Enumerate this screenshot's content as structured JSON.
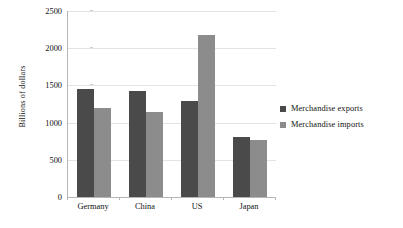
{
  "chart_data": {
    "type": "bar",
    "title": "",
    "subtitle": "",
    "xlabel": "",
    "ylabel": "Billions of dollars",
    "categories": [
      "Germany",
      "China",
      "US",
      "Japan"
    ],
    "series": [
      {
        "name": "Merchandise exports",
        "color": "#4a4a4a",
        "values": [
          1450,
          1425,
          1290,
          800
        ]
      },
      {
        "name": "Merchandise imports",
        "color": "#8c8c8c",
        "values": [
          1200,
          1140,
          2180,
          770
        ]
      }
    ],
    "ylim": [
      0,
      2500
    ],
    "yticks": [
      0,
      500,
      1000,
      1500,
      2000,
      2500
    ],
    "ytick_labels": [
      "0",
      "500",
      "1000",
      "1500",
      "2000",
      "2500"
    ],
    "grid": true,
    "grid_axis": "y",
    "legend_position": "right",
    "annotations": []
  },
  "colors": {
    "background": "#ffffff",
    "axis": "#b5b5b5",
    "gridline": "#e4e4e4",
    "text": "#111111",
    "series_exports": "#4a4a4a",
    "series_imports": "#8c8c8c"
  }
}
